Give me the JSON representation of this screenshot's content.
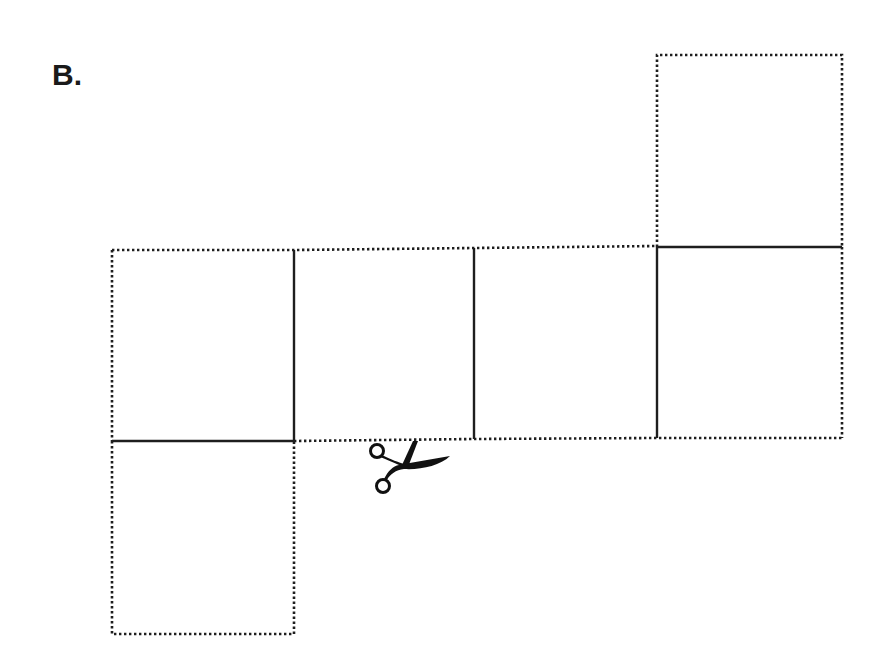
{
  "figure": {
    "label": "B.",
    "colors": {
      "line": "#1e1e1e",
      "background": "#ffffff"
    },
    "legend_semantics": {
      "dotted": "cut line",
      "solid": "fold line"
    },
    "faces": [
      {
        "id": "top-flap",
        "x": 657,
        "y": 55,
        "w": 185,
        "h": 192
      },
      {
        "id": "strip-1",
        "x": 112,
        "y": 250,
        "w": 182,
        "h": 191
      },
      {
        "id": "strip-2",
        "x": 294,
        "y": 250,
        "w": 180,
        "h": 190
      },
      {
        "id": "strip-3",
        "x": 474,
        "y": 248,
        "w": 183,
        "h": 191
      },
      {
        "id": "strip-4",
        "x": 657,
        "y": 247,
        "w": 185,
        "h": 191
      },
      {
        "id": "bottom-flap",
        "x": 112,
        "y": 441,
        "w": 182,
        "h": 193
      }
    ],
    "scissors_icon": {
      "x": 368,
      "y": 440
    }
  }
}
